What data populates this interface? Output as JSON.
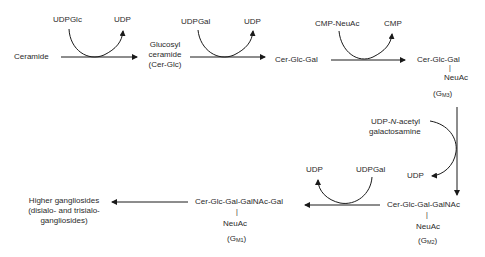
{
  "diagram": {
    "nodes": {
      "ceramide": "Ceramide",
      "glucosyl_ceramide": [
        "Glucosyl",
        "ceramide",
        "(Cer-Glc)"
      ],
      "cer_glc_gal": "Cer-Glc-Gal",
      "gm3": {
        "chain": "Cer-Glc-Gal",
        "branch": "NeuAc",
        "name_main": "(G",
        "name_sub": "M3",
        "name_end": ")"
      },
      "gm2": {
        "chain": "Cer-Glc-Gal-GalNAc",
        "branch": "NeuAc",
        "name_main": "(G",
        "name_sub": "M2",
        "name_end": ")"
      },
      "gm1": {
        "chain": "Cer-Glc-Gal-GalNAc-Gal",
        "branch": "NeuAc",
        "name_main": "(G",
        "name_sub": "M1",
        "name_end": ")"
      },
      "higher": [
        "Higher gangliosides",
        "(disialo- and trisialo-",
        "gangliosides)"
      ]
    },
    "cofactors": {
      "step1": {
        "in": "UDPGlc",
        "out": "UDP"
      },
      "step2": {
        "in": "UDPGal",
        "out": "UDP"
      },
      "step3": {
        "in": "CMP-NeuAc",
        "out": "CMP"
      },
      "step4": {
        "in_prefix": "UDP-",
        "in_italic": "N",
        "in_suffix": "-acetyl",
        "in_line2": "galactosamine",
        "out": "UDP"
      },
      "step5": {
        "in": "UDPGal",
        "out": "UDP"
      }
    },
    "bar_glyph": "|",
    "colors": {
      "line": "#1a1a1a",
      "text": "#2a2a2a"
    }
  }
}
